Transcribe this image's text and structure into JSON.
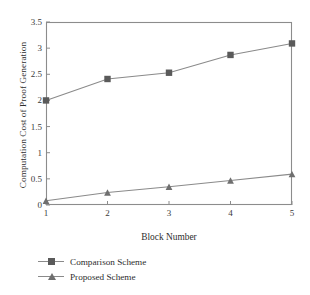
{
  "chart_data": {
    "type": "line",
    "title": "",
    "xlabel": "Block Number",
    "ylabel": "Computation Cost of Proof Generation",
    "x": [
      1,
      2,
      3,
      4,
      5
    ],
    "xticklabels": [
      "1",
      "2",
      "3",
      "4",
      "5"
    ],
    "yticklabels": [
      "0",
      "0.5",
      "1",
      "1.5",
      "2",
      "2.5",
      "3",
      "3.5"
    ],
    "ytickvalues": [
      0,
      0.5,
      1,
      1.5,
      2,
      2.5,
      3,
      3.5
    ],
    "xlim": [
      1,
      5
    ],
    "ylim": [
      0,
      3.5
    ],
    "grid": false,
    "legend_position": "below-axes-left",
    "series": [
      {
        "name": "Comparison Scheme",
        "marker": "square",
        "color": "#5a5a5a",
        "values": [
          2.0,
          2.41,
          2.53,
          2.87,
          3.09
        ]
      },
      {
        "name": "Proposed Scheme",
        "marker": "triangle",
        "color": "#6f6f6f",
        "values": [
          0.08,
          0.24,
          0.35,
          0.47,
          0.59
        ]
      }
    ]
  },
  "axes": {
    "frame_color": "#8c8c8c",
    "tick_color": "#8c8c8c"
  }
}
